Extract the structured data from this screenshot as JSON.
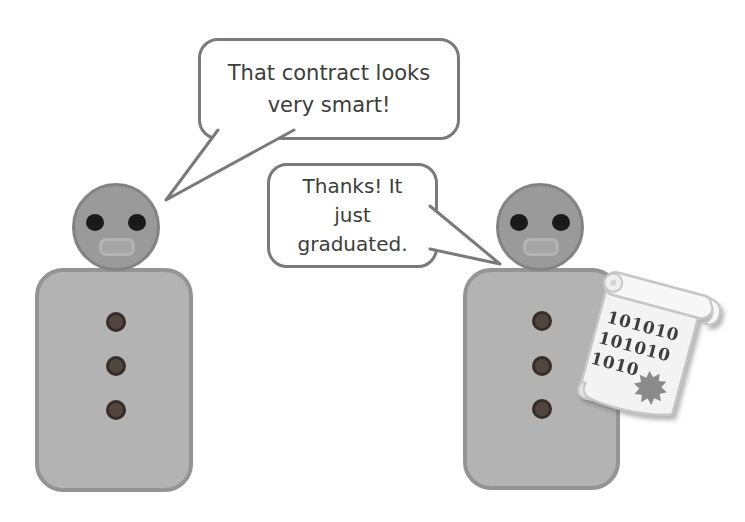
{
  "speech_bubbles": [
    {
      "speaker": "left-figure",
      "lines": [
        "That contract looks",
        "very smart!"
      ]
    },
    {
      "speaker": "right-figure",
      "lines": [
        "Thanks! It",
        "just",
        "graduated."
      ]
    }
  ],
  "scroll": {
    "lines": [
      "101010",
      "101010",
      "1010"
    ],
    "seal_icon": "starburst-seal"
  },
  "figures": [
    {
      "name": "left-figure",
      "buttons": 3
    },
    {
      "name": "right-figure",
      "buttons": 3,
      "holding": "binary-scroll"
    }
  ],
  "colors": {
    "background": "#ffffff",
    "bubble_border": "#7a7a7a",
    "bubble_text": "#3d3d3d",
    "head_fill": "#9a9a9a",
    "head_border": "#838383",
    "body_fill": "#b3b3b3",
    "body_border": "#949494",
    "eye": "#1a1a1a",
    "mouth_border": "#b4b4b4",
    "button_fill": "#50463e",
    "button_border": "#342d28",
    "scroll_paper": "#f3f3f3",
    "scroll_edge": "#c6c6c6",
    "scroll_text": "#3e3e3e",
    "seal": "#8b8b8b"
  }
}
